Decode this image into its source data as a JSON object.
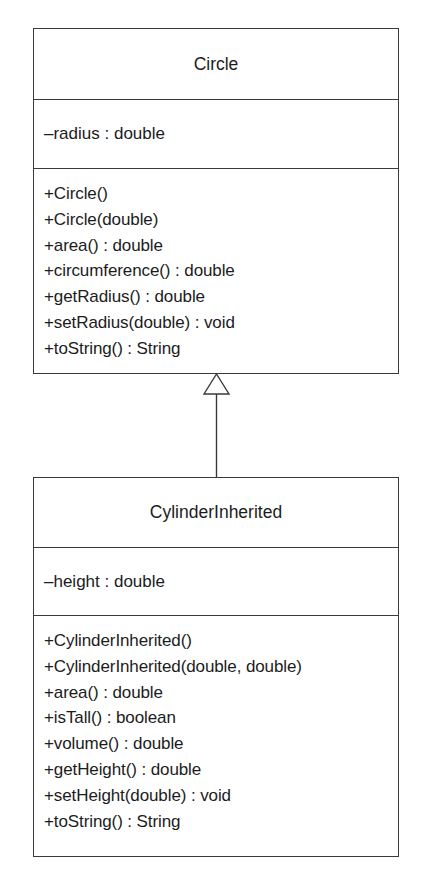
{
  "diagram": {
    "type": "UML class diagram",
    "classes": [
      {
        "name": "Circle",
        "attributes": [
          "–radius : double"
        ],
        "operations": [
          "+Circle()",
          "+Circle(double)",
          "+area() : double",
          "+circumference() : double",
          "+getRadius() : double",
          "+setRadius(double) : void",
          "+toString() : String"
        ]
      },
      {
        "name": "CylinderInherited",
        "attributes": [
          "–height : double"
        ],
        "operations": [
          "+CylinderInherited()",
          "+CylinderInherited(double, double)",
          "+area() : double",
          "+isTall() : boolean",
          "+volume() : double",
          "+getHeight() : double",
          "+setHeight(double) : void",
          "+toString() : String"
        ]
      }
    ],
    "relationships": [
      {
        "type": "generalization",
        "from": "CylinderInherited",
        "to": "Circle",
        "arrow": "hollow-triangle"
      }
    ],
    "colors": {
      "line": "#3a3a3a",
      "text": "#1c1c1c",
      "background": "#ffffff"
    }
  }
}
